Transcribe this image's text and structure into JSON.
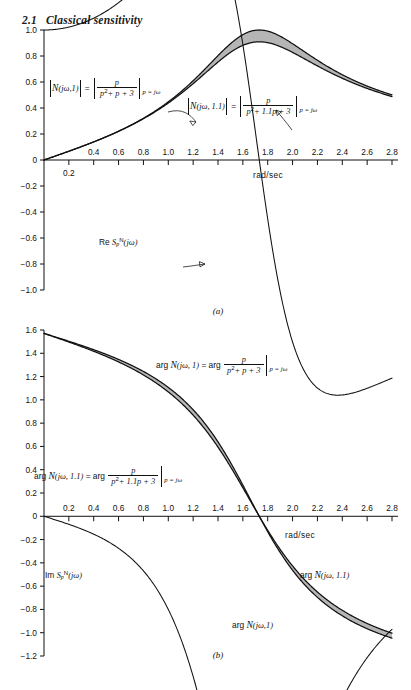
{
  "section": {
    "number": "2.1",
    "title": "Classical sensitivity"
  },
  "axis": {
    "x_label": "rad/sec",
    "x_ticks": [
      "0.2",
      "0.4",
      "0.6",
      "0.8",
      "1.0",
      "1.2",
      "1.4",
      "1.6",
      "1.8",
      "2.0",
      "2.2",
      "2.4",
      "2.6",
      "2.8"
    ],
    "x_min": 0,
    "x_max": 2.8,
    "x_step": 0.2,
    "panel_a_y_ticks": [
      "1.0",
      "0.8",
      "0.6",
      "0.4",
      "0.2",
      "0",
      "-0.2",
      "-0.4",
      "-0.6",
      "-0.8",
      "-1.0"
    ],
    "panel_b_y_ticks": [
      "1.6",
      "1.4",
      "1.2",
      "1.0",
      "0.8",
      "0.6",
      "0.4",
      "0.2",
      "0",
      "-0.2",
      "-0.4",
      "-0.6",
      "-0.8",
      "-1.0",
      "-1.2"
    ]
  },
  "panel_a": {
    "label": "(a)",
    "anno_mag1": {
      "lhs_fn": "N",
      "lhs_args": "(jω,1)",
      "num": "p",
      "den_a": "p",
      "den_b": "+ p + 3",
      "eval": "p = jω"
    },
    "anno_mag11": {
      "lhs_fn": "N",
      "lhs_args": "(jω, 1.1)",
      "num": "p",
      "den_a": "p",
      "den_b": "+ 1.1p + 3",
      "eval": "p = jω"
    },
    "anno_res": {
      "re": "Re",
      "fn": "S",
      "sub": "p",
      "sup": "N",
      "arg": "(jω)"
    }
  },
  "panel_b": {
    "label": "(b)",
    "anno_arg1": {
      "arg": "arg",
      "fn": "N",
      "args": "(jω, 1)",
      "eq": "= arg",
      "num": "p",
      "den_a": "p",
      "den_b": "+ p + 3",
      "eval": "p = jω"
    },
    "anno_arg11": {
      "arg": "arg",
      "fn": "N",
      "args": "(jω, 1.1)",
      "eq": "= arg",
      "num": "p",
      "den_a": "p",
      "den_b": "+ 1.1p + 3",
      "eval": "p = jω"
    },
    "anno_ims": {
      "im": "Im",
      "fn": "S",
      "sub": "p",
      "sup": "N",
      "arg": "(jω)"
    },
    "anno_curve11": {
      "arg": "arg",
      "fn": "N",
      "args": "(jω, 1.1)"
    },
    "anno_curve1": {
      "arg": "arg",
      "fn": "N",
      "args": "(jω,1)"
    }
  },
  "chart_data": {
    "type": "line",
    "xlabel": "rad/sec",
    "x_range": [
      0,
      2.8
    ],
    "grid": false,
    "panels": [
      {
        "id": "a",
        "label": "(a)",
        "ylim": [
          -1.0,
          1.0
        ],
        "ytick_step": 0.2,
        "series": [
          {
            "name": "|N(jω,1)|",
            "formula": "abs(p/(p^2+p+3)) at p=jw",
            "shaded_band_with": "|N(jω,1.1)|",
            "x": [
              0,
              0.2,
              0.4,
              0.6,
              0.8,
              1.0,
              1.2,
              1.4,
              1.6,
              1.7,
              1.732,
              1.8,
              2.0,
              2.2,
              2.4,
              2.6,
              2.8
            ],
            "y": [
              0,
              0.067,
              0.138,
              0.215,
              0.302,
              0.408,
              0.541,
              0.709,
              0.891,
              0.96,
              0.577,
              0.962,
              0.869,
              0.762,
              0.669,
              0.592,
              0.529
            ]
          },
          {
            "name": "|N(jω,1.1)|",
            "formula": "abs(p/(p^2+1.1p+3)) at p=jw",
            "x": [
              0,
              0.2,
              0.4,
              0.6,
              0.8,
              1.0,
              1.2,
              1.4,
              1.6,
              1.7,
              1.732,
              1.8,
              2.0,
              2.2,
              2.4,
              2.6,
              2.8
            ],
            "y": [
              0,
              0.067,
              0.137,
              0.213,
              0.299,
              0.402,
              0.528,
              0.683,
              0.846,
              0.905,
              0.909,
              0.902,
              0.823,
              0.731,
              0.647,
              0.576,
              0.517
            ]
          },
          {
            "name": "Re S_p^N(jω)",
            "formula": "Re of sensitivity of N to p",
            "x": [
              0,
              0.2,
              0.4,
              0.6,
              0.8,
              1.0,
              1.2,
              1.4,
              1.6,
              1.732,
              1.8,
              1.9,
              2.0,
              2.2,
              2.4,
              2.6,
              2.8
            ],
            "y": [
              0,
              -0.013,
              -0.055,
              -0.128,
              -0.238,
              -0.391,
              -0.59,
              -0.812,
              -0.975,
              -1.0,
              -0.985,
              -0.935,
              -0.866,
              -0.7,
              -0.549,
              -0.43,
              -0.34
            ]
          }
        ]
      },
      {
        "id": "b",
        "label": "(b)",
        "ylim": [
          -1.2,
          1.6
        ],
        "ytick_step": 0.2,
        "yunit": "radians",
        "series": [
          {
            "name": "arg N(jω,1)",
            "formula": "arg(p/(p^2+p+3)) at p=jw",
            "shaded_band_with": "arg N(jω,1.1)",
            "x": [
              0,
              0.2,
              0.4,
              0.6,
              0.8,
              1.0,
              1.2,
              1.4,
              1.6,
              1.732,
              1.8,
              2.0,
              2.2,
              2.4,
              2.6,
              2.8
            ],
            "y": [
              1.571,
              1.503,
              1.43,
              1.348,
              1.25,
              1.124,
              0.95,
              0.69,
              0.297,
              0.0,
              -0.137,
              -0.424,
              -0.61,
              -0.735,
              -0.824,
              -0.89
            ]
          },
          {
            "name": "arg N(jω,1.1)",
            "formula": "arg(p/(p^2+1.1p+3)) at p=jw",
            "x": [
              0,
              0.2,
              0.4,
              0.6,
              0.8,
              1.0,
              1.2,
              1.4,
              1.6,
              1.732,
              1.8,
              2.0,
              2.2,
              2.4,
              2.6,
              2.8
            ],
            "y": [
              1.571,
              1.498,
              1.421,
              1.334,
              1.23,
              1.098,
              0.917,
              0.655,
              0.272,
              0.0,
              -0.125,
              -0.392,
              -0.57,
              -0.692,
              -0.78,
              -0.847
            ]
          },
          {
            "name": "Im S_p^N(jω)",
            "formula": "Im of sensitivity of N to p",
            "x": [
              0,
              0.2,
              0.4,
              0.6,
              0.8,
              1.0,
              1.2,
              1.4,
              1.6,
              1.732,
              1.8,
              1.9,
              2.0,
              2.2,
              2.4,
              2.6,
              2.8
            ],
            "y": [
              0,
              -0.115,
              -0.228,
              -0.33,
              -0.413,
              -0.47,
              -0.495,
              -0.47,
              -0.34,
              0.0,
              0.185,
              0.33,
              0.4,
              0.435,
              0.43,
              0.42,
              0.41
            ]
          }
        ]
      }
    ]
  }
}
